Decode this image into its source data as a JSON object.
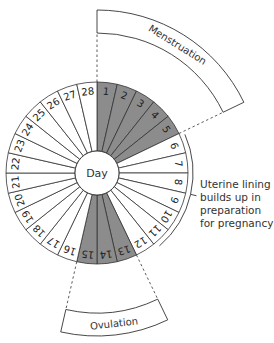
{
  "diagram": {
    "center_label": "Day",
    "days": [
      1,
      2,
      3,
      4,
      5,
      6,
      7,
      8,
      9,
      10,
      11,
      12,
      13,
      14,
      15,
      16,
      17,
      18,
      19,
      20,
      21,
      22,
      23,
      24,
      25,
      26,
      27,
      28
    ],
    "shaded_days": [
      1,
      2,
      3,
      4,
      5,
      13,
      14,
      15
    ],
    "colors": {
      "shaded": "#8c8c8c",
      "unshaded": "#ffffff",
      "stroke": "#333333"
    },
    "phases": [
      {
        "label": "Menstruation",
        "start_day": 1,
        "end_day": 5
      },
      {
        "label": "Ovulation",
        "start_day": 13,
        "end_day": 15
      }
    ],
    "annotation": {
      "lines": [
        "Uterine lining",
        "builds up in",
        "preparation",
        "for pregnancy"
      ],
      "start_day": 6,
      "end_day": 11
    }
  }
}
